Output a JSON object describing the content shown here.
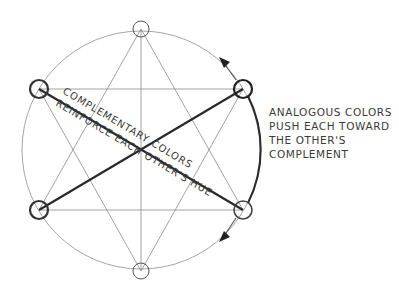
{
  "diagram": {
    "colors": {
      "background": "#ffffff",
      "thin_line": "#8a8a8a",
      "thick_line": "#2a2a2a",
      "text": "#3a3a3a"
    },
    "wheel": {
      "cx": 141,
      "cy": 150,
      "r": 119
    },
    "nodes": [
      {
        "name": "top",
        "cx": 141,
        "cy": 29,
        "emphasis": false
      },
      {
        "name": "upper-left",
        "cx": 39,
        "cy": 89,
        "emphasis": true
      },
      {
        "name": "upper-right",
        "cx": 243,
        "cy": 89,
        "emphasis": true
      },
      {
        "name": "lower-right",
        "cx": 243,
        "cy": 210,
        "emphasis": false
      },
      {
        "name": "bottom",
        "cx": 141,
        "cy": 271,
        "emphasis": false
      },
      {
        "name": "lower-left",
        "cx": 39,
        "cy": 210,
        "emphasis": true
      }
    ],
    "complementary_label_line1": "COMPLEMENTARY COLORS",
    "complementary_label_line2": "REINFORCE EACH OTHER'S HUE",
    "analogous_note": [
      "ANALOGOUS COLORS",
      "PUSH EACH TOWARD",
      "THE OTHER'S",
      "COMPLEMENT"
    ]
  }
}
